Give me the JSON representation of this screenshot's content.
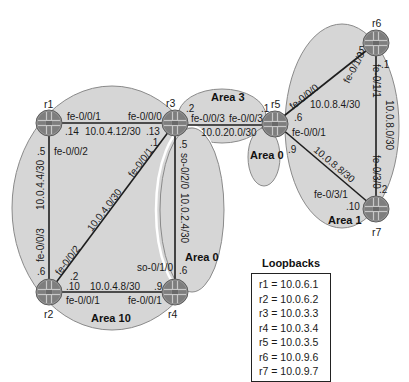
{
  "areas": {
    "area10": "Area 10",
    "area0_core": "Area 0",
    "area3": "Area 3",
    "area0_r5": "Area 0",
    "area1": "Area 1"
  },
  "routers": {
    "r1": "r1",
    "r2": "r2",
    "r3": "r3",
    "r4": "r4",
    "r5": "r5",
    "r6": "r6",
    "r7": "r7"
  },
  "links": {
    "r1_r3": {
      "subnet": "10.0.4.12/30",
      "r1_iface": "fe-0/0/1",
      "r1_host": ".14",
      "r3_iface": "fe-0/0/0",
      "r3_host": ".13"
    },
    "r1_r2": {
      "subnet": "10.0.4.4/30",
      "r1_iface": "fe-0/0/2",
      "r1_host": ".5",
      "r2_iface": "fe-0/0/3",
      "r2_host": ".6"
    },
    "r2_r3": {
      "subnet": "10.0.4.0/30",
      "r2_iface": "fe-0/0/2",
      "r2_host": ".2",
      "r3_iface": "fe-0/0/1",
      "r3_host": ".1"
    },
    "r2_r4": {
      "subnet": "10.0.4.8/30",
      "r2_iface": "fe-0/0/1",
      "r2_host": ".10",
      "r4_iface": "fe-0/0/1",
      "r4_host": ".9"
    },
    "r3_r4": {
      "subnet": "10.0.2.4/30",
      "r3_iface": "so-0/2/0",
      "r3_host": ".5",
      "r4_iface": "so-0/1/0",
      "r4_host": ".6"
    },
    "r3_r5": {
      "subnet": "10.0.20.0/30",
      "r3_iface": "fe-0/0/3",
      "r3_host": ".2",
      "r5_iface": "fe-0/0/3",
      "r5_host": ".1"
    },
    "r5_r6": {
      "subnet": "10.0.8.4/30",
      "r5_iface": "fe-0/0/0",
      "r5_host": ".6",
      "r6_iface": "fe-0/1/0",
      "r6_host": ".5"
    },
    "r5_r7": {
      "subnet": "10.0.8.8/30",
      "r5_iface": "fe-0/0/1",
      "r5_host": ".9",
      "r7_iface": "fe-0/3/1",
      "r7_host": ".10"
    },
    "r6_r7": {
      "subnet": "10.0.8.0/30",
      "r6_iface": "fe-0/1/1",
      "r6_host": ".1",
      "r7_iface": "fe-0/3/0",
      "r7_host": ".2"
    }
  },
  "loopbacks": {
    "title": "Loopbacks",
    "entries": [
      "r1 = 10.0.6.1",
      "r2 = 10.0.6.2",
      "r3 = 10.0.3.3",
      "r4 = 10.0.3.4",
      "r5 = 10.0.3.5",
      "r6 = 10.0.9.6",
      "r7 = 10.0.9.7"
    ]
  },
  "colors": {
    "area_fill": "#d6d6d6",
    "area_stroke": "#8a8a8a",
    "router_body": "#7e7e7e",
    "link": "#1e1e1e"
  }
}
